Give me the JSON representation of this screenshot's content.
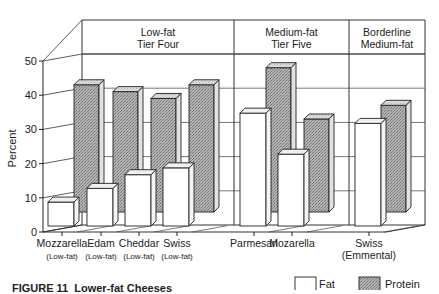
{
  "chart_data": {
    "type": "bar",
    "style": "3d-grouped",
    "ylabel": "Percent",
    "xlabel": "",
    "ylim": [
      0,
      50
    ],
    "yticks": [
      0,
      10,
      20,
      30,
      40,
      50
    ],
    "grid": true,
    "legend_position": "bottom-right",
    "categories": [
      {
        "name": "Mozzarella",
        "sub": "(Low-fat)"
      },
      {
        "name": "Edam",
        "sub": "(Low-fat)"
      },
      {
        "name": "Cheddar",
        "sub": "(Low-fat)"
      },
      {
        "name": "Swiss",
        "sub": "(Low-fat)"
      },
      {
        "name": "Parmesan",
        "sub": ""
      },
      {
        "name": "Mozarella",
        "sub": ""
      },
      {
        "name": "Swiss",
        "sub": "(Emmental)"
      }
    ],
    "series": [
      {
        "name": "Fat",
        "color": "#ffffff",
        "values": [
          7,
          11,
          15,
          17,
          33,
          21,
          30
        ]
      },
      {
        "name": "Protein",
        "color": "#a9a9a9",
        "pattern": "stipple",
        "values": [
          41,
          39,
          37,
          41,
          46,
          31,
          35
        ]
      }
    ],
    "tiers": [
      {
        "line1": "Low-fat",
        "line2": "Tier Four",
        "categories": [
          0,
          1,
          2,
          3
        ]
      },
      {
        "line1": "Medium-fat",
        "line2": "Tier Five",
        "categories": [
          4,
          5
        ]
      },
      {
        "line1": "Borderline",
        "line2": "Medium-fat",
        "categories": [
          6
        ]
      }
    ]
  },
  "caption": {
    "figure_number": "FIGURE 11",
    "title": "Lower-fat Cheeses"
  },
  "legend": [
    {
      "label": "Fat",
      "swatch": "#ffffff"
    },
    {
      "label": "Protein",
      "swatch": "#a9a9a9"
    }
  ]
}
